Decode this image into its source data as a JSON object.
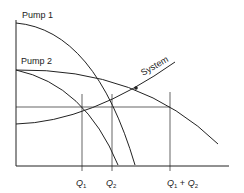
{
  "diagram": {
    "labels": {
      "pump1": "Pump 1",
      "pump2": "Pump 2",
      "system": "System"
    },
    "x_ticks": [
      {
        "base": "Q",
        "sub": "1",
        "suffix": ""
      },
      {
        "base": "Q",
        "sub": "2",
        "suffix": ""
      },
      {
        "base": "Q",
        "sub": "1",
        "suffix": " + ",
        "base2": "Q",
        "sub2": "2"
      }
    ],
    "colors": {
      "line": "#222222",
      "background": "#ffffff"
    }
  }
}
